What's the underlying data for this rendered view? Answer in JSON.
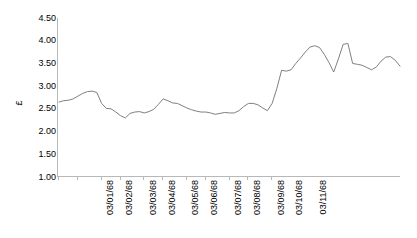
{
  "chart_data": {
    "type": "line",
    "title": "",
    "subtitle": "",
    "xlabel": "",
    "ylabel": "£",
    "ylim": [
      1.0,
      4.5
    ],
    "ytick_labels": [
      "4.50",
      "4.00",
      "3.50",
      "3.00",
      "2.50",
      "2.00",
      "1.50",
      "1.00"
    ],
    "ytick_values": [
      4.5,
      4.0,
      3.5,
      3.0,
      2.5,
      2.0,
      1.5,
      1.0
    ],
    "grid": false,
    "legend": "none",
    "series_color": "#808080",
    "axis_color": "#b8b8b8",
    "x_major_tick_labels": [
      "03/01/68",
      "03/02/68",
      "03/03/68",
      "03/04/68",
      "03/05/68",
      "03/06/68",
      "03/07/68",
      "03/08/68",
      "03/09/68",
      "03/10/68",
      "03/11/68"
    ],
    "x_major_tick_indices": [
      0,
      4,
      9,
      13,
      18,
      22,
      27,
      31,
      36,
      40,
      45
    ],
    "series": [
      {
        "name": "£",
        "values": [
          2.65,
          2.68,
          2.69,
          2.72,
          2.78,
          2.84,
          2.88,
          2.89,
          2.86,
          2.62,
          2.51,
          2.5,
          2.43,
          2.35,
          2.3,
          2.4,
          2.43,
          2.44,
          2.41,
          2.44,
          2.49,
          2.6,
          2.72,
          2.68,
          2.63,
          2.62,
          2.57,
          2.52,
          2.48,
          2.45,
          2.43,
          2.43,
          2.41,
          2.38,
          2.4,
          2.42,
          2.41,
          2.41,
          2.46,
          2.55,
          2.62,
          2.62,
          2.59,
          2.52,
          2.46,
          2.62,
          2.95,
          3.35,
          3.33,
          3.36,
          3.5,
          3.62,
          3.75,
          3.86,
          3.89,
          3.85,
          3.7,
          3.52,
          3.31,
          3.6,
          3.92,
          3.94,
          3.5,
          3.48,
          3.46,
          3.41,
          3.36,
          3.42,
          3.55,
          3.64,
          3.65,
          3.57,
          3.44
        ]
      }
    ]
  }
}
